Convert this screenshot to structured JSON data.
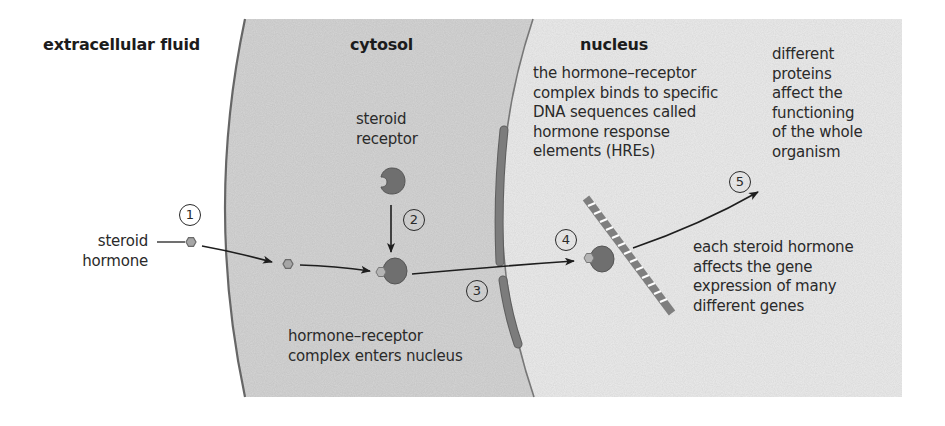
{
  "regions": {
    "extracellular": {
      "label": "extracellular fluid",
      "color": "#ffffff"
    },
    "cytosol": {
      "label": "cytosol",
      "color": "#d5d5d5"
    },
    "nucleus": {
      "label": "nucleus",
      "color": "#ececec"
    }
  },
  "colors": {
    "receptor": "#6b6b6b",
    "hormone": "#a9a9a9",
    "envelope": "#7a7a7a",
    "membrane": "#666666",
    "arrow": "#1e1e1e"
  },
  "labels": {
    "steroid_hormone": [
      "steroid",
      "hormone"
    ],
    "steroid_receptor": [
      "steroid",
      "receptor"
    ],
    "complex_enters": [
      "hormone–receptor",
      "complex enters nucleus"
    ],
    "binds_hres": [
      "the hormone–receptor",
      "complex binds to specific",
      "DNA sequences called",
      "hormone response",
      "elements (HREs)"
    ],
    "different_proteins": [
      "different",
      "proteins",
      "affect the",
      "functioning",
      "of the whole",
      "organism"
    ],
    "gene_expression": [
      "each steroid hormone",
      "affects the gene",
      "expression of many",
      "different genes"
    ]
  },
  "steps": [
    "1",
    "2",
    "3",
    "4",
    "5"
  ]
}
